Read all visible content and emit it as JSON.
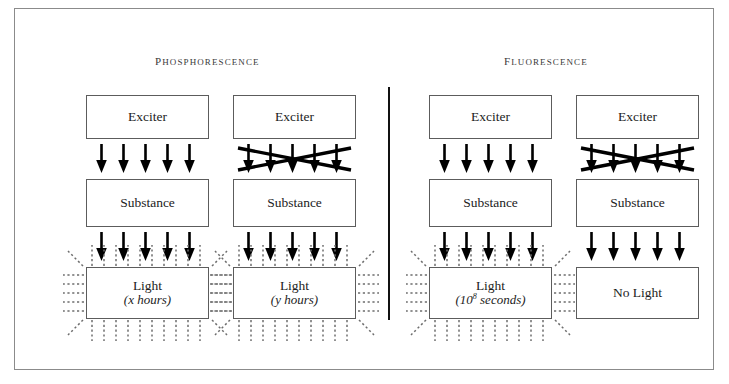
{
  "diagram": {
    "title_left": "Phosphorescence",
    "title_right": "Fluorescence",
    "labels": {
      "exciter": "Exciter",
      "substance": "Substance",
      "light": "Light",
      "no_light": "No Light"
    },
    "colors": {
      "frame": "#8b8b8b",
      "box_border": "#5c5c5c",
      "arrow": "#000000",
      "divider": "#111111",
      "ray": "#6e6e6e",
      "title_text": "#3a3a3a",
      "body_text": "#1c1c1c"
    },
    "arrow_count": 5,
    "columns": [
      {
        "id": "phos-continued",
        "section": "Phosphorescence",
        "top_label": "Exciter",
        "upper_arrows": {
          "count": 5,
          "blocked": false
        },
        "middle_label": "Substance",
        "lower_arrows": {
          "count": 5,
          "blocked": false
        },
        "output_label": "Light",
        "output_sublabel": "(x hours)",
        "output_sublabel_base": "x hours",
        "emits_light": true
      },
      {
        "id": "phos-removed",
        "section": "Phosphorescence",
        "top_label": "Exciter",
        "upper_arrows": {
          "count": 5,
          "blocked": true
        },
        "middle_label": "Substance",
        "lower_arrows": {
          "count": 5,
          "blocked": false
        },
        "output_label": "Light",
        "output_sublabel": "(y hours)",
        "output_sublabel_base": "y hours",
        "emits_light": true
      },
      {
        "id": "fluo-continued",
        "section": "Fluorescence",
        "top_label": "Exciter",
        "upper_arrows": {
          "count": 5,
          "blocked": false
        },
        "middle_label": "Substance",
        "lower_arrows": {
          "count": 5,
          "blocked": false
        },
        "output_label": "Light",
        "output_sublabel": "(10⁻⁸ seconds)",
        "output_sublabel_prefix": "(10",
        "output_sublabel_exponent": "8",
        "output_sublabel_suffix": " seconds)",
        "emits_light": true
      },
      {
        "id": "fluo-removed",
        "section": "Fluorescence",
        "top_label": "Exciter",
        "upper_arrows": {
          "count": 5,
          "blocked": true
        },
        "middle_label": "Substance",
        "lower_arrows": {
          "count": 5,
          "blocked": false
        },
        "output_label": "No Light",
        "output_sublabel": "",
        "emits_light": false
      }
    ]
  }
}
